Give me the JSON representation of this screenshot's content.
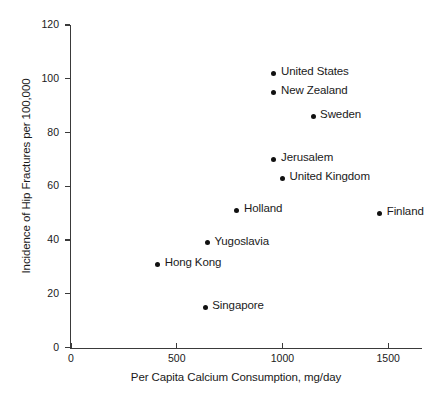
{
  "chart_data": {
    "type": "scatter",
    "title": "",
    "xlabel": "Per Capita Calcium Consumption, mg/day",
    "ylabel": "Incidence of Hip Fractures per 100,000",
    "xlim": [
      0,
      1660
    ],
    "ylim": [
      0,
      120
    ],
    "grid": false,
    "legend": "none",
    "xticks": [
      0,
      500,
      1000,
      1500
    ],
    "xtick_labels": [
      "0",
      "500",
      "1000",
      "1500"
    ],
    "yticks": [
      0,
      20,
      40,
      60,
      80,
      100,
      120
    ],
    "ytick_labels": [
      "0",
      "20",
      "40",
      "60",
      "80",
      "100",
      "120"
    ],
    "point_color": "#111111",
    "points": [
      {
        "label": "United States",
        "x": 960,
        "y": 102,
        "label_side": "right"
      },
      {
        "label": "New Zealand",
        "x": 960,
        "y": 95,
        "label_side": "right"
      },
      {
        "label": "Sweden",
        "x": 1145,
        "y": 86,
        "label_side": "right"
      },
      {
        "label": "Jerusalem",
        "x": 960,
        "y": 70,
        "label_side": "right"
      },
      {
        "label": "United Kingdom",
        "x": 1000,
        "y": 63,
        "label_side": "right"
      },
      {
        "label": "Holland",
        "x": 785,
        "y": 51,
        "label_side": "right"
      },
      {
        "label": "Finland",
        "x": 1460,
        "y": 50,
        "label_side": "right"
      },
      {
        "label": "Yugoslavia",
        "x": 645,
        "y": 39,
        "label_side": "right"
      },
      {
        "label": "Hong Kong",
        "x": 410,
        "y": 31,
        "label_side": "right"
      },
      {
        "label": "Singapore",
        "x": 635,
        "y": 15,
        "label_side": "right"
      }
    ]
  }
}
